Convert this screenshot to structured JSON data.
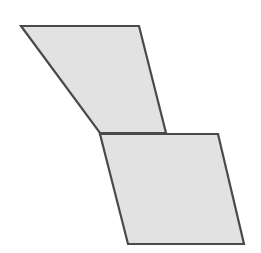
{
  "figure": {
    "name": "two-parallelograms-staircase",
    "background_color": "#ffffff",
    "width": 261,
    "height": 253,
    "shape_count": 2,
    "fill_color": "#e2e2e2",
    "stroke_color": "#4a4a4a",
    "stroke_width": 2.2,
    "shapes": [
      {
        "id": "upper-parallelogram",
        "label": "upper parallelogram",
        "fill": "#e2e2e2",
        "stroke": "#4a4a4a",
        "stroke_width": 2.2,
        "points": "21,26 139,26 166,133 100,133",
        "vertices": [
          {
            "name": "top-left",
            "x": 21,
            "y": 26
          },
          {
            "name": "top-right",
            "x": 139,
            "y": 26
          },
          {
            "name": "bottom-right",
            "x": 166,
            "y": 133
          },
          {
            "name": "bottom-left",
            "x": 100,
            "y": 133
          }
        ]
      },
      {
        "id": "lower-parallelogram",
        "label": "lower parallelogram",
        "fill": "#e2e2e2",
        "stroke": "#4a4a4a",
        "stroke_width": 2.2,
        "points": "100,134 218,134 244,244 128,244",
        "vertices": [
          {
            "name": "top-left",
            "x": 100,
            "y": 134
          },
          {
            "name": "top-right",
            "x": 218,
            "y": 134
          },
          {
            "name": "bottom-right",
            "x": 244,
            "y": 244
          },
          {
            "name": "bottom-left",
            "x": 128,
            "y": 244
          }
        ]
      }
    ]
  }
}
